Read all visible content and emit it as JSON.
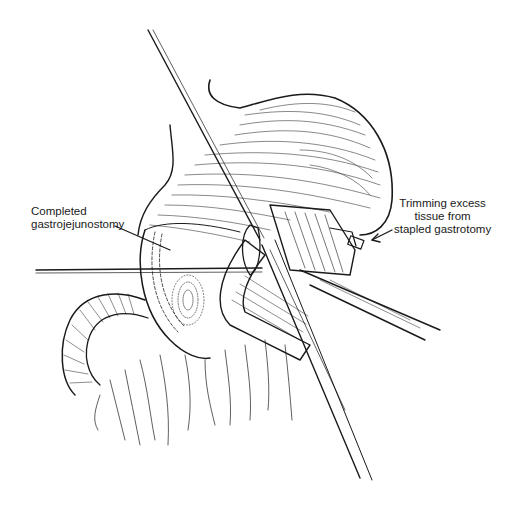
{
  "figure": {
    "type": "surgical-illustration",
    "colors": {
      "ink": "#1a1a1a",
      "background": "#ffffff"
    }
  },
  "labels": {
    "left": {
      "line1": "Completed",
      "line2": "gastrojejunostomy"
    },
    "right": {
      "line1": "Trimming excess",
      "line2": "tissue  from",
      "line3": "stapled gastrotomy"
    }
  }
}
